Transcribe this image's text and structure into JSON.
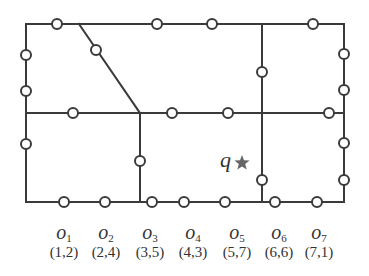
{
  "diagram": {
    "query": {
      "label": "q",
      "icon": "star-icon",
      "color": "#666666",
      "x": 242,
      "y": 163
    },
    "line_color": "#3a3a3a",
    "edges": [
      [
        26,
        24,
        344,
        24
      ],
      [
        26,
        24,
        26,
        202
      ],
      [
        26,
        202,
        344,
        202
      ],
      [
        344,
        24,
        344,
        202
      ],
      [
        26,
        113,
        344,
        113
      ],
      [
        79,
        24,
        140,
        113
      ],
      [
        140,
        113,
        140,
        202
      ],
      [
        262,
        24,
        262,
        202
      ]
    ],
    "nodes": [
      [
        57,
        24
      ],
      [
        157,
        24
      ],
      [
        212,
        24
      ],
      [
        313,
        24
      ],
      [
        96,
        50
      ],
      [
        26,
        55
      ],
      [
        26,
        91
      ],
      [
        26,
        144
      ],
      [
        344,
        54
      ],
      [
        344,
        90
      ],
      [
        344,
        143
      ],
      [
        344,
        180
      ],
      [
        73,
        113
      ],
      [
        172,
        113
      ],
      [
        228,
        113
      ],
      [
        329,
        113
      ],
      [
        140,
        161
      ],
      [
        262,
        72
      ],
      [
        262,
        180
      ],
      [
        64,
        202
      ],
      [
        105,
        202
      ],
      [
        152,
        202
      ],
      [
        184,
        202
      ],
      [
        225,
        202
      ],
      [
        275,
        202
      ],
      [
        317,
        202
      ]
    ],
    "objects": [
      {
        "name": "o",
        "sub": "1",
        "coord": "(1,2)",
        "x": 64
      },
      {
        "name": "o",
        "sub": "2",
        "coord": "(2,4)",
        "x": 106
      },
      {
        "name": "o",
        "sub": "3",
        "coord": "(3,5)",
        "x": 150
      },
      {
        "name": "o",
        "sub": "4",
        "coord": "(4,3)",
        "x": 193
      },
      {
        "name": "o",
        "sub": "5",
        "coord": "(5,7)",
        "x": 237
      },
      {
        "name": "o",
        "sub": "6",
        "coord": "(6,6)",
        "x": 279
      },
      {
        "name": "o",
        "sub": "7",
        "coord": "(7,1)",
        "x": 319
      }
    ]
  }
}
